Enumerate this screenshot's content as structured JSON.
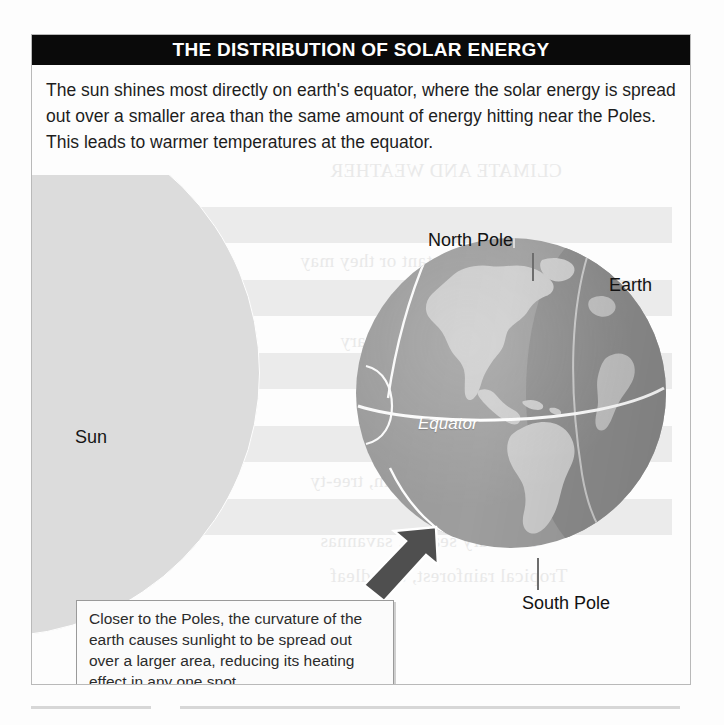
{
  "figure": {
    "title": "THE DISTRIBUTION OF SOLAR ENERGY",
    "intro": "The sun shines most directly on earth's equator, where the solar energy is spread out over a smaller area than the same amount of energy hitting near the Poles. This leads to warmer temperatures at the equator."
  },
  "diagram": {
    "sun_label": "Sun",
    "earth_label": "Earth",
    "north_pole_label": "North Pole",
    "south_pole_label": "South Pole",
    "equator_label": "Equator",
    "callout_text": "Closer to the Poles, the curvature of the earth causes sunlight to be spread out over a larger area, reducing its heating effect in any one spot."
  },
  "colors": {
    "title_bar": "#0a0a0a",
    "title_text": "#ffffff",
    "sun": "#dcdcdc",
    "ray_band": "#ebebeb",
    "ocean": "#9e9e9e",
    "ocean_night": "#8d8d8d",
    "land": "#cdcdcd",
    "graticule": "#ffffff",
    "arrow": "#4f4f4f",
    "frame": "#b9b9b9"
  },
  "bleed_text": [
    "CLIMATE AND WEATHER",
    "relatively constant or they may",
    "vary",
    "average temperature",
    "amount of rain, tree-ty",
    "or hot with strong seasonality",
    "and a dry season, savannas",
    "Tropical rainforest, broadleaf"
  ]
}
